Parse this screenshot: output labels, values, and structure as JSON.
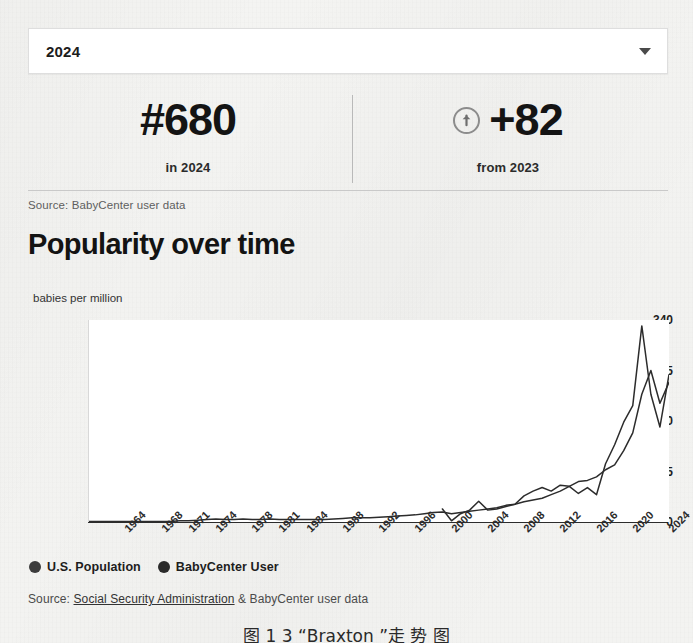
{
  "year_select": {
    "value": "2024",
    "icon": "chevron-down-icon"
  },
  "stats": [
    {
      "value": "#680",
      "caption": "in 2024",
      "icon": null
    },
    {
      "value": "+82",
      "caption": "from 2023",
      "icon": "arrow-up-circle-icon"
    }
  ],
  "source_top": "Source: BabyCenter user data",
  "section_title": "Popularity over time",
  "source_bottom": {
    "prefix": "Source: ",
    "link": "Social Security Administration",
    "suffix": " & BabyCenter user data"
  },
  "figure_caption": "图 1 3 “Braxton ”走 势 图",
  "colors": {
    "line": "#2c2c2c",
    "grid": "#e3e3e3",
    "axis": "#2c2c2c",
    "panel": "#ffffff",
    "page": "#f3f3f1",
    "text": "#1d1d1d",
    "muted": "#5e5e5e"
  },
  "chart_data": {
    "type": "line",
    "title": "Popularity over time",
    "xlabel": "",
    "ylabel": "babies per million",
    "ylim": [
      0,
      340
    ],
    "yticks": [
      340,
      255,
      170,
      85,
      0
    ],
    "grid": true,
    "legend_position": "bottom-left",
    "xticks": [
      "1964",
      "1968",
      "1971",
      "1974",
      "1978",
      "1981",
      "1984",
      "1988",
      "1992",
      "1996",
      "2000",
      "2004",
      "2008",
      "2012",
      "2016",
      "2020",
      "2024"
    ],
    "x": [
      1960,
      1961,
      1962,
      1963,
      1964,
      1965,
      1966,
      1967,
      1968,
      1969,
      1970,
      1971,
      1972,
      1973,
      1974,
      1975,
      1976,
      1977,
      1978,
      1979,
      1980,
      1981,
      1982,
      1983,
      1984,
      1985,
      1986,
      1987,
      1988,
      1989,
      1990,
      1991,
      1992,
      1993,
      1994,
      1995,
      1996,
      1997,
      1998,
      1999,
      2000,
      2001,
      2002,
      2003,
      2004,
      2005,
      2006,
      2007,
      2008,
      2009,
      2010,
      2011,
      2012,
      2013,
      2014,
      2015,
      2016,
      2017,
      2018,
      2019,
      2020,
      2021,
      2022,
      2023,
      2024
    ],
    "series": [
      {
        "name": "U.S. Population",
        "values": [
          1,
          1,
          1,
          1,
          1,
          1,
          1,
          1,
          1,
          1,
          2,
          2,
          3,
          4,
          5,
          4,
          4,
          5,
          4,
          4,
          5,
          4,
          4,
          4,
          4,
          4,
          4,
          5,
          6,
          7,
          7,
          7,
          8,
          9,
          10,
          11,
          12,
          14,
          16,
          17,
          14,
          16,
          18,
          20,
          22,
          24,
          28,
          30,
          34,
          37,
          40,
          46,
          52,
          60,
          68,
          70,
          76,
          88,
          96,
          120,
          150,
          215,
          255,
          200,
          235
        ]
      },
      {
        "name": "BabyCenter User",
        "values": [
          null,
          null,
          null,
          null,
          null,
          null,
          null,
          null,
          null,
          null,
          null,
          null,
          null,
          null,
          null,
          null,
          null,
          null,
          null,
          null,
          null,
          null,
          null,
          null,
          null,
          null,
          null,
          null,
          null,
          null,
          null,
          null,
          null,
          null,
          null,
          null,
          null,
          null,
          null,
          22,
          2,
          14,
          20,
          35,
          20,
          22,
          26,
          30,
          44,
          52,
          58,
          52,
          62,
          60,
          48,
          58,
          46,
          98,
          130,
          168,
          196,
          330,
          215,
          160,
          248
        ]
      }
    ]
  },
  "legend": [
    {
      "label": "U.S. Population",
      "color": "#3c3c3c"
    },
    {
      "label": "BabyCenter User",
      "color": "#2a2a2a"
    }
  ]
}
